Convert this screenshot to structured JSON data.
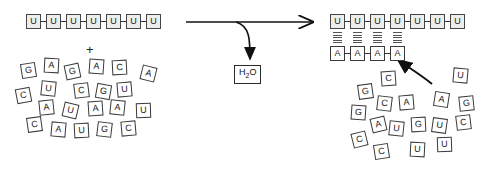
{
  "diagram": {
    "symbols": {
      "plus": "+",
      "byproduct_label": "H",
      "byproduct_sub": "2",
      "byproduct_suffix": "O"
    },
    "colors": {
      "ink": "#2b2b2b",
      "tile_fill": "#ffffff",
      "tile_fill_shaded": "#ededed",
      "bond": "#555555",
      "arrow": "#111111"
    }
  },
  "left_panel": {
    "name": "reactants",
    "template_strand": {
      "label": "poly-U template strand",
      "bases": [
        "U",
        "U",
        "U",
        "U",
        "U",
        "U",
        "U"
      ]
    },
    "plus_symbol": "+",
    "free_nucleotide_pool": {
      "label": "free nucleotide pool",
      "bases": [
        "G",
        "A",
        "G",
        "A",
        "C",
        "A",
        "C",
        "U",
        "C",
        "G",
        "U",
        "A",
        "U",
        "A",
        "A",
        "U",
        "C",
        "A",
        "U",
        "G",
        "C"
      ]
    }
  },
  "reaction": {
    "name": "reaction-arrow",
    "main_arrow_label": "",
    "byproduct": {
      "formula": "H2O",
      "h": "H",
      "two": "2",
      "o": "O"
    }
  },
  "right_panel": {
    "name": "products",
    "template_strand": {
      "label": "poly-U template strand",
      "bases": [
        "U",
        "U",
        "U",
        "U",
        "U",
        "U",
        "U"
      ]
    },
    "paired_strand": {
      "label": "newly paired poly-A strand",
      "bases": [
        "A",
        "A",
        "A",
        "A"
      ],
      "hydrogen_bond_count": 4,
      "dashes_per_bond": 5
    },
    "free_nucleotide_pool": {
      "label": "remaining free nucleotide pool",
      "bases": [
        "C",
        "U",
        "G",
        "C",
        "A",
        "A",
        "G",
        "G",
        "A",
        "U",
        "G",
        "U",
        "C",
        "C",
        "C",
        "U",
        "U"
      ]
    },
    "incoming_arrow_label": ""
  }
}
